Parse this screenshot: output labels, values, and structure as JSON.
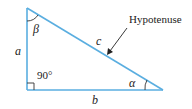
{
  "diagram": {
    "colors": {
      "line": "#5aaee0",
      "text": "#222222",
      "arrow": "#222222"
    },
    "labels": {
      "side_a": "a",
      "side_b": "b",
      "side_c": "c",
      "angle_alpha": "α",
      "angle_beta": "β",
      "right_angle": "90°",
      "hypotenuse": "Hypotenuse"
    }
  }
}
